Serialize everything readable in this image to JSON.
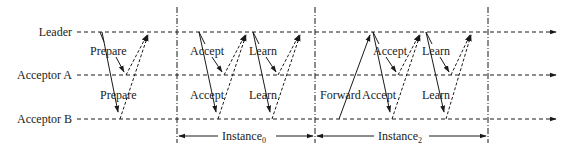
{
  "diagram": {
    "title": "",
    "participants": [
      {
        "id": "leader",
        "label": "Leader",
        "y": 32
      },
      {
        "id": "acceptorA",
        "label": "Acceptor A",
        "y": 75
      },
      {
        "id": "acceptorB",
        "label": "Acceptor B",
        "y": 119
      }
    ],
    "messages": {
      "prepare_a": "Prepare",
      "prepare_b": "Prepare",
      "accept0_a": "Accept",
      "accept0_b": "Accept",
      "learn0_a": "Learn",
      "learn0_b": "Learn",
      "forward": "Forward",
      "accept2_a": "Accept",
      "accept2_b": "Accept",
      "learn2_a": "Learn",
      "learn2_b": "Learn"
    },
    "instances": [
      {
        "label": "Instance",
        "subscript": "0",
        "x_start": 177,
        "x_end": 315
      },
      {
        "label": "Instance",
        "subscript": "2",
        "x_start": 315,
        "x_end": 488
      }
    ],
    "colors": {
      "line": "#1a1a1a",
      "background": "#ffffff"
    }
  }
}
